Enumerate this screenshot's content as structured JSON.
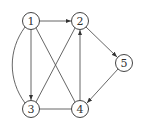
{
  "graph": {
    "nodes": [
      {
        "id": "1",
        "label": "1",
        "x": 31,
        "y": 21
      },
      {
        "id": "2",
        "label": "2",
        "x": 80,
        "y": 21
      },
      {
        "id": "3",
        "label": "3",
        "x": 31,
        "y": 109
      },
      {
        "id": "4",
        "label": "4",
        "x": 80,
        "y": 109
      },
      {
        "id": "5",
        "label": "5",
        "x": 124,
        "y": 63
      }
    ],
    "edges": [
      {
        "from": "1",
        "to": "2",
        "directed": true
      },
      {
        "from": "1",
        "to": "3",
        "directed": true
      },
      {
        "from": "1",
        "to": "3",
        "directed": false,
        "curved": true
      },
      {
        "from": "1",
        "to": "4",
        "directed": false
      },
      {
        "from": "2",
        "to": "3",
        "directed": false
      },
      {
        "from": "4",
        "to": "2",
        "directed": true
      },
      {
        "from": "2",
        "to": "5",
        "directed": true
      },
      {
        "from": "5",
        "to": "4",
        "directed": true
      },
      {
        "from": "3",
        "to": "4",
        "directed": false
      }
    ]
  }
}
